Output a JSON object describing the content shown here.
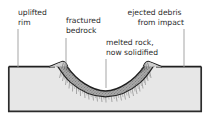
{
  "diagram": {
    "colors": {
      "ground_fill": "#e7e7e7",
      "frame_border": "#2b2b2b",
      "melt_layer": "#9a9a9a",
      "fracture_lines": "#6f6f6f",
      "leader_line": "#9b9b9b",
      "text": "#2b2b2b",
      "background": "#ffffff"
    },
    "labels": [
      {
        "name": "uplifted-rim",
        "line1": "uplifted",
        "line2": "rim",
        "align": "left",
        "text_x": 18,
        "text_y": 15,
        "leader_x": 18,
        "leader_y1": 29,
        "leader_y2": 67
      },
      {
        "name": "fractured-bedrock",
        "line1": "fractured",
        "line2": "bedrock",
        "align": "left",
        "text_x": 66,
        "text_y": 23,
        "leader_x": 66,
        "leader_y1": 38,
        "leader_y2": 68
      },
      {
        "name": "ejected-debris-from-impact",
        "line1": "ejected debris",
        "line2": "from impact",
        "align": "right",
        "text_x": 184,
        "text_y": 15,
        "leader_x": 184,
        "leader_y1": 29,
        "leader_y2": 67
      },
      {
        "name": "melted-rock-now-solidified",
        "line1": "melted rock,",
        "line2": "now solidified",
        "align": "left",
        "text_x": 106,
        "text_y": 45,
        "leader_x": 106,
        "leader_y1": 59,
        "leader_y2": 88
      }
    ],
    "frame": {
      "left": 8,
      "right": 202,
      "top": 66,
      "bottom": 112
    }
  }
}
